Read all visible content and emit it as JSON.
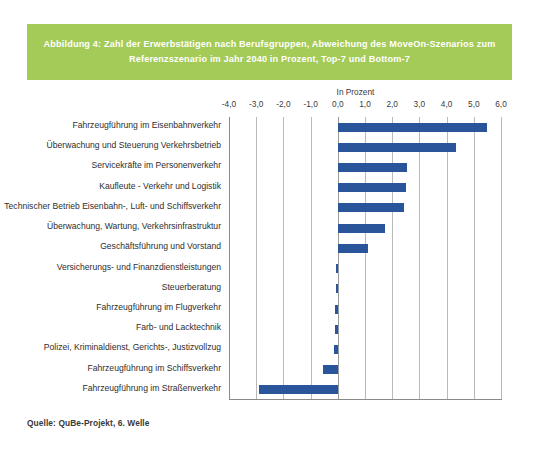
{
  "figure": {
    "title_lines": [
      "Abbildung 4: Zahl der Erwerbstätigen nach Berufsgruppen, Abweichung des MoveOn-Szenarios zum",
      "Referenzszenario im Jahr 2040 in Prozent, Top-7 und Bottom-7"
    ],
    "source": "Quelle: QuBe-Projekt, 6. Welle",
    "banner_color": "#a4ca57",
    "bar_color": "#2a559b"
  },
  "chart_data": {
    "type": "bar",
    "orientation": "horizontal",
    "title": "Abbildung 4: Zahl der Erwerbstätigen nach Berufsgruppen, Abweichung des MoveOn-Szenarios zum Referenzszenario im Jahr 2040 in Prozent, Top-7 und Bottom-7",
    "unit_label": "In Prozent",
    "xlabel": "In Prozent",
    "ylabel": "",
    "xlim": [
      -4.0,
      6.0
    ],
    "xticks": [
      -4.0,
      -3.0,
      -2.0,
      -1.0,
      0.0,
      1.0,
      2.0,
      3.0,
      4.0,
      5.0,
      6.0
    ],
    "xtick_labels": [
      "-4,0",
      "-3,0",
      "-2,0",
      "-1,0",
      "0,0",
      "1,0",
      "2,0",
      "3,0",
      "4,0",
      "5,0",
      "6,0"
    ],
    "grid": true,
    "legend": false,
    "categories": [
      "Fahrzeugführung im Eisenbahnverkehr",
      "Überwachung und Steuerung Verkehrsbetrieb",
      "Servicekräfte im Personenverkehr",
      "Kaufleute - Verkehr und Logistik",
      "Technischer Betrieb Eisenbahn-, Luft- und Schiffsverkehr",
      "Überwachung, Wartung, Verkehrsinfrastruktur",
      "Geschäftsführung und Vorstand",
      "Versicherungs- und Finanzdienstleistungen",
      "Steuerberatung",
      "Fahrzeugführung im Flugverkehr",
      "Farb- und Lacktechnik",
      "Polizei, Kriminaldienst, Gerichts-, Justizvollzug",
      "Fahrzeugführung im Schiffsverkehr",
      "Fahrzeugführung im Straßenverkehr"
    ],
    "values": [
      5.5,
      4.35,
      2.55,
      2.5,
      2.45,
      1.75,
      1.1,
      -0.08,
      -0.08,
      -0.1,
      -0.12,
      -0.14,
      -0.55,
      -2.9
    ]
  }
}
